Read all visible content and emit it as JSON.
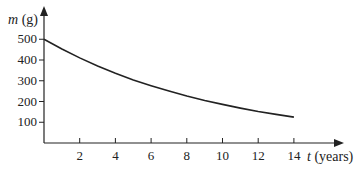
{
  "chart_data": {
    "type": "line",
    "title": "",
    "xlabel_var": "t",
    "xlabel_unit": "(years)",
    "ylabel_var": "m",
    "ylabel_unit": "(g)",
    "x_ticks": [
      2,
      4,
      6,
      8,
      10,
      12,
      14
    ],
    "y_ticks": [
      100,
      200,
      300,
      400,
      500
    ],
    "xlim": [
      0,
      15
    ],
    "ylim": [
      0,
      520
    ],
    "grid": false,
    "legend": null,
    "series": [
      {
        "name": "m(t)",
        "x": [
          0,
          1,
          2,
          3,
          4,
          5,
          6,
          7,
          8,
          9,
          10,
          11,
          12,
          13,
          14
        ],
        "values": [
          500,
          453,
          410,
          371,
          336,
          304,
          276,
          250,
          226,
          205,
          186,
          168,
          152,
          138,
          125
        ]
      }
    ]
  },
  "colors": {
    "axis": "#222222",
    "curve": "#222222"
  }
}
